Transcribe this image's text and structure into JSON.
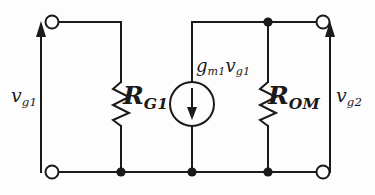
{
  "figure": {
    "kind": "small-signal-equivalent-circuit",
    "background_color": "#fdfdfd",
    "ink_color": "#1a1a1a"
  },
  "labels": {
    "left_port": {
      "symbol": "v",
      "subscript": "g1",
      "full": "vg1"
    },
    "right_port": {
      "symbol": "v",
      "subscript": "g2",
      "full": "vg2"
    },
    "left_resistor": {
      "symbol": "R",
      "subscript": "G1",
      "full": "RG1"
    },
    "right_resistor": {
      "symbol": "R",
      "subscript": "OM",
      "full": "ROM"
    },
    "current_source": {
      "gain_symbol": "g",
      "gain_subscript": "m1",
      "control_symbol": "v",
      "control_subscript": "g1",
      "full": "gm1vg1"
    }
  },
  "components": {
    "resistors": [
      {
        "name": "RG1",
        "orientation": "vertical",
        "zigzag_peaks": 4
      },
      {
        "name": "ROM",
        "orientation": "vertical",
        "zigzag_peaks": 4
      }
    ],
    "current_sources": [
      {
        "name": "gm1vg1",
        "shape": "circle",
        "arrow_direction": "down",
        "dependent": true
      }
    ],
    "terminals": [
      {
        "name": "top-left-terminal",
        "style": "open-circle"
      },
      {
        "name": "bottom-left-terminal",
        "style": "open-circle"
      },
      {
        "name": "top-right-terminal",
        "style": "open-circle"
      },
      {
        "name": "bottom-right-terminal",
        "style": "open-circle"
      }
    ],
    "junction_dots": [
      {
        "name": "bottom-rail-node-rg1"
      },
      {
        "name": "bottom-rail-node-source"
      },
      {
        "name": "bottom-rail-node-rom"
      },
      {
        "name": "top-rail-node-rom"
      }
    ],
    "voltage_arrows": [
      {
        "name": "vg1-arrow",
        "direction": "up",
        "side": "left"
      },
      {
        "name": "vg2-arrow",
        "direction": "up",
        "side": "right"
      }
    ]
  }
}
